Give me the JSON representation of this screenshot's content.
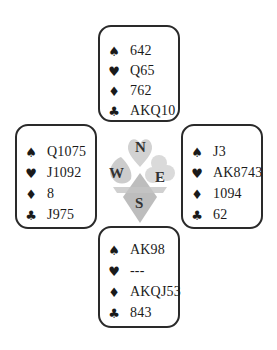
{
  "hands": {
    "north": {
      "spades": "642",
      "hearts": "Q65",
      "diamonds": "762",
      "clubs": "AKQ10"
    },
    "west": {
      "spades": "Q1075",
      "hearts": "J1092",
      "diamonds": "8",
      "clubs": "J975"
    },
    "east": {
      "spades": "J3",
      "hearts": "AK8743",
      "diamonds": "1094",
      "clubs": "62"
    },
    "south": {
      "spades": "AK98",
      "hearts": "---",
      "diamonds": "AKQJ53",
      "clubs": "843"
    }
  },
  "suit_symbols": {
    "spades": "♠",
    "hearts": "♥",
    "diamonds": "♦",
    "clubs": "♣"
  },
  "compass": {
    "n": "N",
    "e": "E",
    "s": "S",
    "w": "W"
  },
  "colors": {
    "border": "#2a2a2a",
    "logo_gray": "#c8c8c8",
    "text": "#1a1a1a"
  }
}
